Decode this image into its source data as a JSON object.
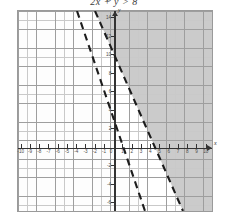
{
  "title": "2x + y > 8",
  "axes": {
    "x_label": "x",
    "y_label": "y",
    "x_ticks": [
      "-10",
      "-9",
      "-8",
      "-7",
      "-6",
      "-5",
      "-4",
      "-3",
      "-2",
      "-1",
      "0",
      "1",
      "2",
      "3",
      "4",
      "5",
      "6",
      "7",
      "8",
      "9",
      "10"
    ],
    "y_ticks": [
      "-6",
      "-4",
      "-2",
      "2",
      "4",
      "6",
      "8",
      "10",
      "12",
      "14",
      "16"
    ],
    "xlim": [
      -10,
      10
    ],
    "ylim": [
      -7,
      17
    ]
  },
  "chart_data": {
    "type": "line",
    "title": "2x + y > 8",
    "xlabel": "x",
    "ylabel": "y",
    "xlim": [
      -10,
      10
    ],
    "ylim": [
      -7,
      17
    ],
    "grid": true,
    "legend": "none",
    "series": [
      {
        "name": "boundary-line-1",
        "style": "dashed",
        "slope": -4,
        "intercept": 8,
        "x_intercept": 2,
        "y_intercept": 8,
        "points": [
          [
            -2,
            16
          ],
          [
            0,
            8
          ],
          [
            2,
            0
          ],
          [
            3.75,
            -7
          ]
        ]
      },
      {
        "name": "boundary-line-2",
        "style": "dashed",
        "slope": -2.8,
        "intercept": 11.2,
        "x_intercept": 4,
        "y_intercept": 11.2,
        "points": [
          [
            -1.7,
            16
          ],
          [
            0,
            11.2
          ],
          [
            4,
            0
          ],
          [
            6.5,
            -7
          ]
        ]
      }
    ],
    "regions": [
      {
        "name": "left-region",
        "fill": "hatch",
        "description": "diagonally hatched region left of both dashed lines"
      },
      {
        "name": "right-region",
        "fill": "solid-gray",
        "description": "solid gray shaded region right of both dashed lines"
      },
      {
        "name": "between-region",
        "fill": "white",
        "description": "unshaded white wedge between the two dashed lines"
      }
    ]
  },
  "colors": {
    "grid_minor": "#c9c9c9",
    "grid_major": "#9e9e9e",
    "axis": "#333333",
    "line": "#1d1d1d",
    "shade_solid": "#828282",
    "shade_hatch": "#787878",
    "frame": "#9a9a9a",
    "background": "#ffffff"
  }
}
